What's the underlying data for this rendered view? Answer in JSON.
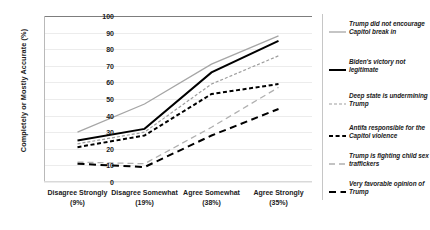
{
  "chart_data": {
    "type": "line",
    "title": "",
    "xlabel": "",
    "ylabel": "Completely or Mostly Accurate (%)",
    "ylim": [
      0,
      100
    ],
    "ytick_step": 10,
    "yticks": [
      0,
      10,
      20,
      30,
      40,
      50,
      60,
      70,
      80,
      90,
      100
    ],
    "grid": true,
    "legend_position": "right",
    "categories": [
      "Disagree Strongly",
      "Disagree Somewhat",
      "Agree Somewhat",
      "Agree Strongly"
    ],
    "category_percents": [
      "(9%)",
      "(19%)",
      "(38%)",
      "(35%)"
    ],
    "category_labels": [
      "Disagree Strongly\n(9%)",
      "Disagree Somewhat\n(19%)",
      "Agree Somewhat\n(38%)",
      "Agree Strongly\n(35%)"
    ],
    "series": [
      {
        "name": "Trump did not encourage Capitol break in",
        "values": [
          30,
          47,
          71,
          88
        ],
        "color": "#a6a6a6",
        "style": "solid",
        "width": 1.3
      },
      {
        "name": "Biden's victory not legitimate",
        "values": [
          25,
          32,
          66,
          85
        ],
        "color": "#000000",
        "style": "solid",
        "width": 2.0
      },
      {
        "name": "Deep state is undermining Trump",
        "values": [
          23,
          30,
          59,
          76
        ],
        "color": "#9e9e9e",
        "style": "dashed-fine",
        "width": 1.2
      },
      {
        "name": "Antifa responsible for the Capitol violence",
        "values": [
          21,
          28,
          53,
          59
        ],
        "color": "#000000",
        "style": "dashed",
        "width": 2.0
      },
      {
        "name": "Trump is fighting child sex traffickers",
        "values": [
          12,
          11,
          33,
          57
        ],
        "color": "#b0b0b0",
        "style": "longdash-light",
        "width": 1.3
      },
      {
        "name": "Very favorable opinion of Trump",
        "values": [
          11,
          9,
          28,
          44
        ],
        "color": "#000000",
        "style": "longdash",
        "width": 2.0
      }
    ]
  },
  "legend": {
    "items": [
      {
        "label": "Trump did not encourage Capitol break in"
      },
      {
        "label": "Biden's victory not legitimate"
      },
      {
        "label": "Deep state is undermining Trump"
      },
      {
        "label": "Antifa responsible for the Capitol violence"
      },
      {
        "label": "Trump is fighting child sex traffickers"
      },
      {
        "label": "Very favorable opinion of Trump"
      }
    ]
  }
}
